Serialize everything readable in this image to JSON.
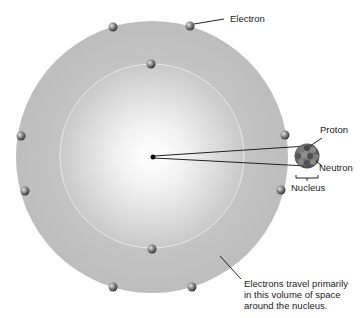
{
  "diagram": {
    "type": "atom-model",
    "labels": {
      "electron": "Electron",
      "proton": "Proton",
      "neutron": "Neutron",
      "nucleus": "Nucleus",
      "note_line1": "Electrons travel primarily",
      "note_line2": "in this volume of space",
      "note_line3": "around the nucleus."
    },
    "colors": {
      "outer_shell": "#c4c4c4",
      "inner_shell": "#d9d9d9",
      "center_glow": "#ffffff",
      "electron": "#6e6e6e",
      "nucleus": "#5a5a5a",
      "line": "#222222"
    },
    "electron_count": 10
  }
}
